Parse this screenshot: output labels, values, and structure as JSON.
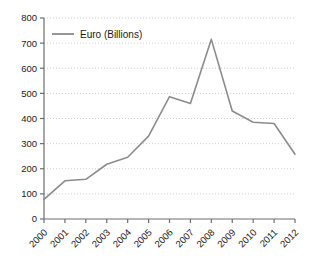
{
  "chart_data": {
    "type": "line",
    "title": "",
    "xlabel": "",
    "ylabel": "",
    "categories": [
      "2000",
      "2001",
      "2002",
      "2003",
      "2004",
      "2005",
      "2006",
      "2007",
      "2008",
      "2009",
      "2010",
      "2011",
      "2012"
    ],
    "series": [
      {
        "name": "Euro (Billions)",
        "color": "#8c8c8c",
        "values": [
          78,
          152,
          158,
          218,
          246,
          330,
          487,
          460,
          715,
          430,
          385,
          380,
          258
        ]
      }
    ],
    "ylim": [
      0,
      800
    ],
    "yticks": [
      0,
      100,
      200,
      300,
      400,
      500,
      600,
      700,
      800
    ],
    "ytick_labels": [
      "0",
      "100",
      "200",
      "300",
      "400",
      "500",
      "600",
      "700",
      "800"
    ],
    "grid": "horizontal-dotted",
    "legend": {
      "position": "top-left-inside",
      "entries": [
        {
          "label": "Euro (Billions)",
          "color": "#8c8c8c"
        }
      ]
    },
    "xtick_rotation": -45,
    "axis_color": "#6e6e6e",
    "grid_color": "#cfcfcf",
    "background": "#ffffff"
  }
}
